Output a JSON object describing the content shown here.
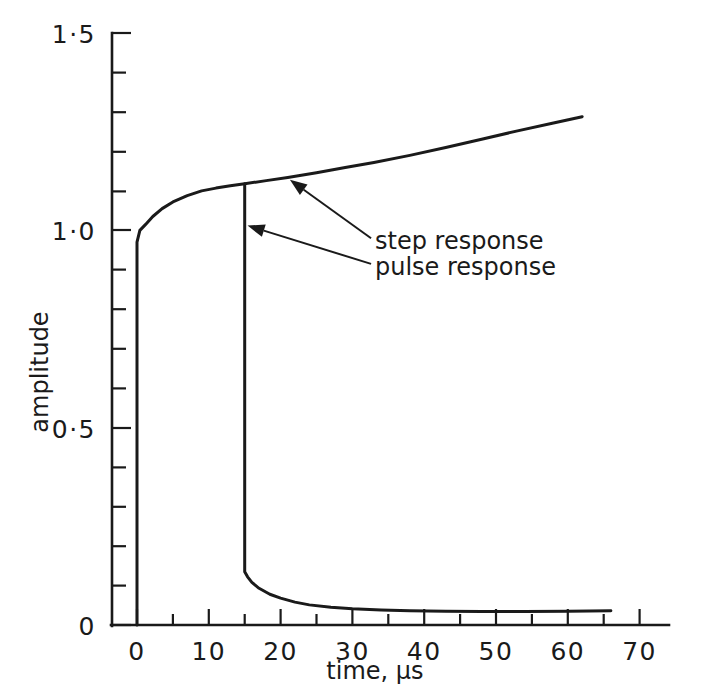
{
  "chart_data": {
    "type": "line",
    "title": "",
    "xlabel": "time, µs",
    "ylabel": "amplitude",
    "xlim": [
      0,
      70
    ],
    "ylim": [
      0,
      1.5
    ],
    "grid": false,
    "legend_position": "inline-annotations",
    "x_ticks_major": [
      0,
      10,
      20,
      30,
      40,
      50,
      60,
      70
    ],
    "x_tick_labels": [
      "0",
      "10",
      "20",
      "30",
      "40",
      "50",
      "60",
      "70"
    ],
    "x_ticks_minor_step": 5,
    "y_ticks_major": [
      0,
      0.5,
      1.0,
      1.5
    ],
    "y_tick_labels": [
      "0",
      "0·5",
      "1·0",
      "1·5"
    ],
    "y_ticks_minor_step": 0.1,
    "series": [
      {
        "name": "step response",
        "points": [
          [
            0,
            0
          ],
          [
            0,
            0.97
          ],
          [
            0.4,
            1.0
          ],
          [
            1.2,
            1.015
          ],
          [
            2.2,
            1.035
          ],
          [
            3.5,
            1.055
          ],
          [
            5,
            1.072
          ],
          [
            7,
            1.088
          ],
          [
            9,
            1.1
          ],
          [
            11,
            1.107
          ],
          [
            13,
            1.113
          ],
          [
            15,
            1.118
          ],
          [
            18,
            1.126
          ],
          [
            21,
            1.134
          ],
          [
            25,
            1.146
          ],
          [
            29,
            1.159
          ],
          [
            33,
            1.172
          ],
          [
            38,
            1.19
          ],
          [
            43,
            1.21
          ],
          [
            48,
            1.231
          ],
          [
            53,
            1.252
          ],
          [
            58,
            1.272
          ],
          [
            62,
            1.288
          ]
        ]
      },
      {
        "name": "pulse response",
        "points": [
          [
            15,
            1.118
          ],
          [
            15,
            0.135
          ],
          [
            15.4,
            0.122
          ],
          [
            16,
            0.108
          ],
          [
            17,
            0.093
          ],
          [
            18.5,
            0.078
          ],
          [
            20,
            0.068
          ],
          [
            22,
            0.058
          ],
          [
            24,
            0.051
          ],
          [
            27,
            0.045
          ],
          [
            30,
            0.041
          ],
          [
            34,
            0.038
          ],
          [
            38,
            0.036
          ],
          [
            43,
            0.035
          ],
          [
            48,
            0.034
          ],
          [
            54,
            0.034
          ],
          [
            60,
            0.035
          ],
          [
            66,
            0.036
          ]
        ]
      }
    ],
    "annotations": [
      {
        "text": "step response",
        "text_x": 62.5,
        "text_y": 0.965,
        "arrow_tip_x": 21.3,
        "arrow_tip_y": 1.128,
        "arrow_tail_x": 32.6,
        "arrow_tail_y": 0.98
      },
      {
        "text": "pulse response",
        "text_x": 62.5,
        "text_y": 0.865,
        "arrow_tip_x": 15.4,
        "arrow_tip_y": 1.012,
        "arrow_tail_x": 32.6,
        "arrow_tail_y": 0.915
      }
    ]
  },
  "axes": {
    "y_title": "amplitude",
    "x_title": "time, µs",
    "y_labels": {
      "v0": "0",
      "v05": "0·5",
      "v10": "1·0",
      "v15": "1·5"
    },
    "x_labels": {
      "t0": "0",
      "t10": "10",
      "t20": "20",
      "t30": "30",
      "t40": "40",
      "t50": "50",
      "t60": "60",
      "t70": "70"
    }
  },
  "annotations": {
    "step": "step response",
    "pulse": "pulse response"
  },
  "colors": {
    "ink": "#1a1a1a",
    "background": "#ffffff"
  }
}
